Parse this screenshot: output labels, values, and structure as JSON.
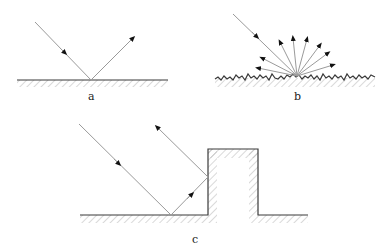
{
  "labels": {
    "a": "a",
    "b": "b",
    "c": "c"
  },
  "figure": {
    "panels": [
      {
        "id": "a",
        "description": "Specular reflection from a smooth surface"
      },
      {
        "id": "b",
        "description": "Diffuse reflection from a rough surface"
      },
      {
        "id": "c",
        "description": "Multiple reflection off floor and wall of a block"
      }
    ]
  },
  "colors": {
    "ray": "#9a9a9a",
    "surface": "#3a3a3a",
    "hatch": "#a0a0a0",
    "arrow": "#111111"
  }
}
